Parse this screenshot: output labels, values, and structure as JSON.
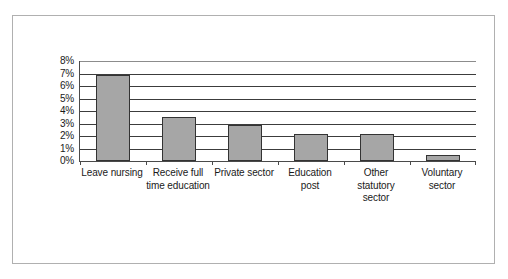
{
  "chart_data": {
    "type": "bar",
    "title": "",
    "xlabel": "",
    "ylabel": "",
    "categories": [
      "Leave nursing",
      "Receive full time education",
      "Private sector",
      "Education post",
      "Other statutory sector",
      "Voluntary sector"
    ],
    "values": [
      6.9,
      3.5,
      2.9,
      2.2,
      2.2,
      0.5
    ],
    "ylim": [
      0,
      8
    ],
    "ytick_labels": [
      "8%",
      "7%",
      "6%",
      "5%",
      "4%",
      "3%",
      "2%",
      "1%",
      "0%"
    ],
    "ytick_values": [
      8,
      7,
      6,
      5,
      4,
      3,
      2,
      1,
      0
    ],
    "value_unit": "%",
    "grid": true,
    "legend": false,
    "bar_color": "#a6a6a6",
    "bar_border_color": "#333333",
    "axis_color": "#4a4a4a",
    "frame_color": "#b0b0b0",
    "background": "#ffffff"
  }
}
